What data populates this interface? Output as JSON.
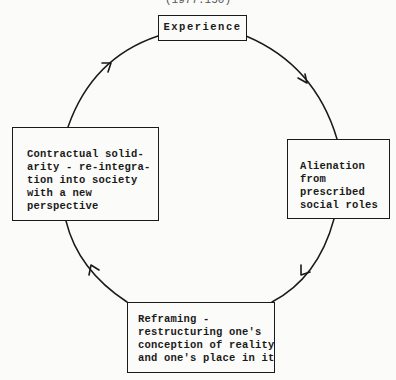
{
  "caption_fragment": "(1977:150)",
  "diagram": {
    "type": "cycle",
    "nodes": [
      {
        "id": "experience",
        "label": "Experience"
      },
      {
        "id": "alienation",
        "label": "Alienation\nfrom\nprescribed\nsocial roles"
      },
      {
        "id": "reframing",
        "label": "Reframing -\nrestructuring one's\nconception of reality\nand one's place in it"
      },
      {
        "id": "solidarity",
        "label": "Contractual solid-\narity - re-integra-\ntion into society\nwith a new\nperspective"
      }
    ],
    "edges": [
      {
        "from": "experience",
        "to": "alienation",
        "direction": "clockwise"
      },
      {
        "from": "alienation",
        "to": "reframing",
        "direction": "clockwise"
      },
      {
        "from": "reframing",
        "to": "solidarity",
        "direction": "clockwise"
      },
      {
        "from": "solidarity",
        "to": "experience",
        "direction": "clockwise"
      }
    ]
  },
  "colors": {
    "stroke": "#1a1a1a",
    "background": "#fbfbf9"
  }
}
